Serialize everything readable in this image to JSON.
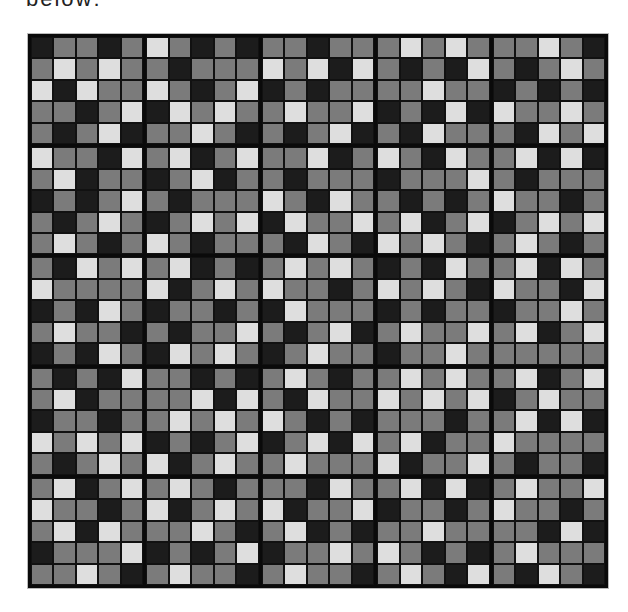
{
  "caption": "below:",
  "palette": {
    "D": "#1c1c1c",
    "M": "#7b7b7b",
    "L": "#dedede",
    "grid_line": "#0a0a0a"
  },
  "grid": {
    "block_rows": 5,
    "block_cols": 5,
    "cells_per_block": 5,
    "blocks": [
      [
        [
          "DMMDM",
          "MLMLM",
          "LDLMM",
          "MMDML",
          "MDMLD"
        ],
        [
          "LMDMD",
          "MDMMM",
          "LMDML",
          "DLMLM",
          "MMLMD"
        ],
        [
          "MMDMM",
          "LMLDL",
          "DMDMM",
          "MLMML",
          "MDMLD"
        ],
        [
          "MLMLM",
          "MDMDL",
          "MMLMM",
          "DMDLD",
          "MDLMM"
        ],
        [
          "MMLMD",
          "MDMLM",
          "DMDMD",
          "LMMLM",
          "MDLML"
        ]
      ],
      [
        [
          "LMMDL",
          "MLDMM",
          "DMDML",
          "MDMLM",
          "MLMDM"
        ],
        [
          "MLDML",
          "DMLDM",
          "MDMMM",
          "DMLML",
          "LMDMM"
        ],
        [
          "MMLDM",
          "MDMMM",
          "LMDLM",
          "DLMML",
          "MDLMD"
        ],
        [
          "LMDLM",
          "DMMML",
          "MDMDM",
          "MLDML",
          "LMLMD"
        ],
        [
          "MLDLD",
          "MDMMM",
          "LMMDM",
          "DMLML",
          "MLMDM"
        ]
      ],
      [
        [
          "MDLML",
          "LMMMM",
          "DMDLM",
          "MLMMD",
          "DMDLM"
        ],
        [
          "MLDMD",
          "LDMLM",
          "DMMDM",
          "MDMML",
          "DLMLM"
        ],
        [
          "MLMLM",
          "LMMDM",
          "DLMMM",
          "MDMLD",
          "DMLMM"
        ],
        [
          "DMDLM",
          "LMLMD",
          "DMDMM",
          "MLMML",
          "DMMLM"
        ],
        [
          "MLDLM",
          "LMMDL",
          "DMMLM",
          "MLDML",
          "MMMMM"
        ]
      ],
      [
        [
          "MDMDL",
          "MLDMM",
          "DMMDM",
          "LMLML",
          "MDMLM"
        ],
        [
          "MMDMD",
          "MMLDL",
          "MLMLM",
          "DMDML",
          "LDMLM"
        ],
        [
          "MLMDM",
          "MDLMM",
          "LMDMD",
          "DMLDL",
          "MLMMM"
        ],
        [
          "MLMLM",
          "LMLML",
          "MMMDM",
          "MLDMM",
          "LDMML"
        ],
        [
          "MLDML",
          "DMLMM",
          "MLDLD",
          "LMMMM",
          "MDMMD"
        ]
      ],
      [
        [
          "MLDML",
          "LMMDM",
          "MLDLM",
          "DMMML",
          "MMLMD"
        ],
        [
          "MLMDM",
          "LDMLM",
          "MMLMD",
          "DMDML",
          "MLMMD"
        ],
        [
          "MMDLM",
          "LDMML",
          "MLDMD",
          "DMMLM",
          "MLMMD"
        ],
        [
          "MLDLD",
          "DMMDM",
          "MMLMM",
          "LMDMD",
          "MLMDL"
        ],
        [
          "MLMML",
          "LMMDM",
          "MMDLD",
          "MLMMM",
          "MDLMD"
        ]
      ]
    ]
  }
}
